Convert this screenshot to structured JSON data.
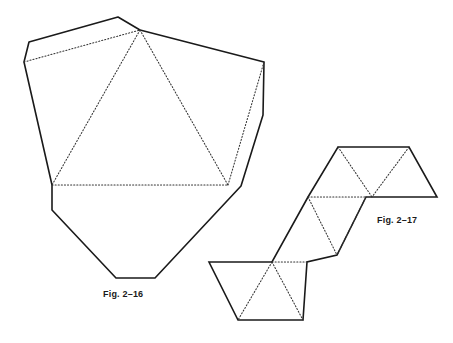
{
  "page": {
    "background_color": "#ffffff",
    "stroke_color": "#1a1a1a",
    "width": 453,
    "height": 343
  },
  "figures": [
    {
      "id": "fig-2-16",
      "label": "Fig. 2–16",
      "description": "Irregular polygon net with dotted interior fold lines forming a central triangle and flanking triangles",
      "solid_outline": "118,17 29,42 24,62 52,185 52,210 116,278 155,278 241,186 263,115 264,62 140,30",
      "dotted_segments": [
        "24,62 140,30",
        "140,30 52,185",
        "140,30 228,185",
        "52,185 228,185",
        "228,185 264,62"
      ]
    },
    {
      "id": "fig-2-17",
      "label": "Fig. 2–17",
      "description": "Zigzag strip net of triangles arranged in three offset rows with dotted interior fold lines",
      "solid_outline": "338,147 409,147 437,197 366,197 337,255 307,262 303,320 238,320 209,262 272,262 308,197",
      "dotted_segments": [
        "338,147 372,197",
        "409,147 372,197",
        "308,197 366,197",
        "308,197 337,255",
        "366,197 337,255",
        "272,262 303,320",
        "272,262 238,320",
        "272,262 307,262"
      ]
    }
  ]
}
